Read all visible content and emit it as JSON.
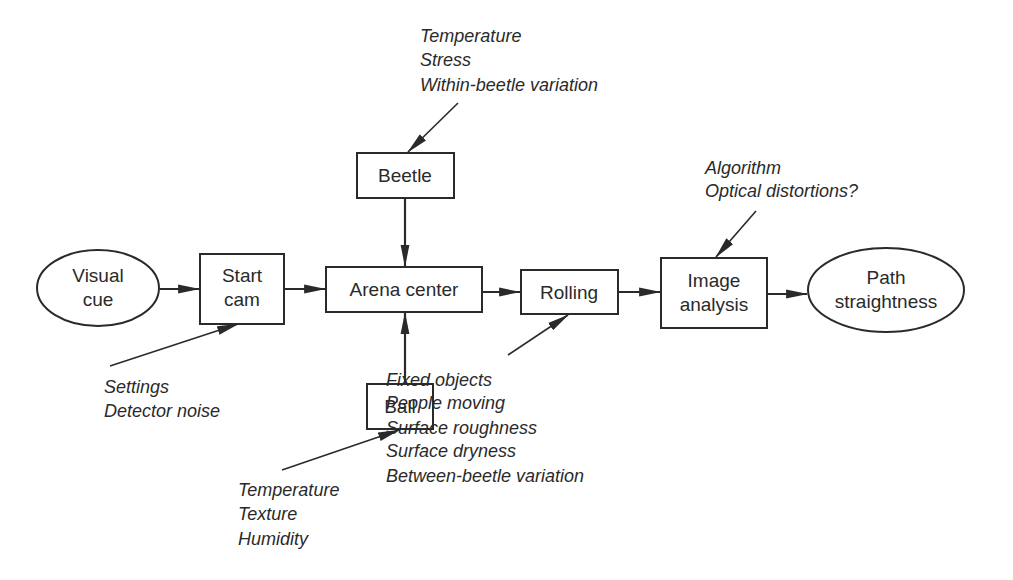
{
  "diagram": {
    "type": "flowchart",
    "nodes": {
      "visual_cue": {
        "shape": "ellipse",
        "line1": "Visual",
        "line2": "cue"
      },
      "start_cam": {
        "shape": "box",
        "line1": "Start",
        "line2": "cam"
      },
      "arena_center": {
        "shape": "box",
        "label": "Arena center"
      },
      "beetle": {
        "shape": "box",
        "label": "Beetle"
      },
      "ball": {
        "shape": "box",
        "label": "Ball"
      },
      "rolling": {
        "shape": "box",
        "label": "Rolling"
      },
      "image_analysis": {
        "shape": "box",
        "line1": "Image",
        "line2": "analysis"
      },
      "path_straightness": {
        "shape": "ellipse",
        "line1": "Path",
        "line2": "straightness"
      }
    },
    "edges": [
      [
        "Visual cue",
        "Start cam"
      ],
      [
        "Start cam",
        "Arena center"
      ],
      [
        "Beetle",
        "Arena center"
      ],
      [
        "Ball",
        "Arena center"
      ],
      [
        "Arena center",
        "Rolling"
      ],
      [
        "Rolling",
        "Image analysis"
      ],
      [
        "Image analysis",
        "Path straightness"
      ]
    ],
    "notes": {
      "beetle": [
        "Temperature",
        "Stress",
        "Within-beetle variation"
      ],
      "start_cam": [
        "Settings",
        "Detector noise"
      ],
      "ball": [
        "Temperature",
        "Texture",
        "Humidity"
      ],
      "rolling": [
        "Fixed objects",
        "People moving",
        "Surface roughness",
        "Surface dryness",
        "Between-beetle variation"
      ],
      "image_analysis": [
        "Algorithm",
        "Optical distortions?"
      ]
    }
  }
}
